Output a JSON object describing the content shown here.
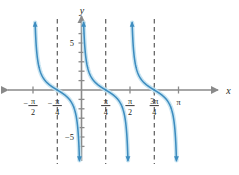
{
  "figure": {
    "name": "cotangent-graph",
    "axis_labels": {
      "x": "x",
      "y": "y"
    },
    "y_ticks": [
      {
        "value": 5,
        "label": "5"
      },
      {
        "value": -5,
        "label": "−5"
      }
    ],
    "x_ticks": [
      {
        "value": -1.5707963,
        "label_num": "π",
        "label_den": "2",
        "sign": "−"
      },
      {
        "value": -0.7853981,
        "label_num": "π",
        "label_den": "4",
        "sign": "−"
      },
      {
        "value": 0.7853981,
        "label_num": "π",
        "label_den": "4",
        "sign": ""
      },
      {
        "value": 1.5707963,
        "label_num": "π",
        "label_den": "2",
        "sign": ""
      },
      {
        "value": 2.3561944,
        "label_num": "3π",
        "label_den": "4",
        "sign": ""
      },
      {
        "value": 3.1415926,
        "label_num": "π",
        "label_den": "",
        "sign": ""
      }
    ],
    "asymptotes": [
      -0.7853981,
      0.7853981,
      2.3561944
    ],
    "colors": {
      "curve": "#3d8cbf",
      "curve_glow": "#bfe0f0",
      "axis": "#8a8a8a",
      "asymptote": "#3a3a3a",
      "text": "#231f20"
    }
  },
  "chart_data": {
    "type": "line",
    "title": "",
    "xlabel": "x",
    "ylabel": "y",
    "xlim": [
      -1.9634954,
      3.5342917
    ],
    "ylim": [
      -6.6,
      6.6
    ],
    "grid": false,
    "legend": null,
    "function": "y = cot(2x)",
    "period": 1.5707963,
    "asymptotes_x": [
      -1.5707963,
      -0.7853981,
      0.0,
      0.7853981,
      1.5707963,
      2.3561944,
      3.1415926
    ],
    "drawn_asymptotes_x": [
      -0.7853981,
      0.7853981,
      2.3561944
    ],
    "zeros_x": [
      -1.1780972,
      -0.3926991,
      0.3926991,
      1.1780972,
      1.9634954,
      2.7488936
    ],
    "x_tick_values": [
      -1.5707963,
      -0.7853981,
      0.7853981,
      1.5707963,
      2.3561944,
      3.1415926
    ],
    "x_tick_labels": [
      "−π/2",
      "−π/4",
      "π/4",
      "π/2",
      "3π/4",
      "π"
    ],
    "y_tick_values": [
      -6,
      -5,
      -4,
      -3,
      -2,
      -1,
      1,
      2,
      3,
      4,
      5,
      6
    ],
    "y_tick_labels_shown": [
      "5",
      "−5"
    ],
    "branches": [
      {
        "domain": [
          -1.5707963,
          -0.7853981
        ],
        "from_y": "+inf",
        "to_y": "-inf",
        "visible_part": "right tail only (enters from left edge near y=0 down to -inf)"
      },
      {
        "domain": [
          -0.7853981,
          0.0
        ],
        "from_y": "+inf",
        "to_y": "-inf"
      },
      {
        "domain": [
          0.0,
          0.7853981
        ],
        "from_y": "+inf",
        "to_y": "-inf"
      },
      {
        "domain": [
          0.7853981,
          1.5707963
        ],
        "from_y": "+inf",
        "to_y": "-inf"
      },
      {
        "domain": [
          1.5707963,
          2.3561944
        ],
        "from_y": "+inf",
        "to_y": "-inf"
      },
      {
        "domain": [
          2.3561944,
          3.1415926
        ],
        "from_y": "+inf",
        "to_y": "-inf",
        "visible_part": "upper portion to right, approaches y=0 near π"
      }
    ]
  }
}
